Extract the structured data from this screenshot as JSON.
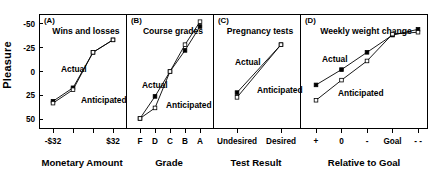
{
  "figure": {
    "y_axis_label": "Pleasure",
    "y_ticks": [
      "50",
      "25",
      "0",
      "-25",
      "-50"
    ],
    "series_names": [
      "Actual",
      "Anticipated"
    ],
    "ink_color": "#000000"
  },
  "panels": [
    {
      "key": "A",
      "panel_letter": "(A)",
      "title": "Wins and losses",
      "xlabel": "Monetary Amount",
      "x_tick_labels": [
        "-$32",
        "",
        "",
        "$32"
      ],
      "actual_label": "Actual",
      "anticipated_label": "Anticipated"
    },
    {
      "key": "B",
      "panel_letter": "(B)",
      "title": "Course grades",
      "xlabel": "Grade",
      "x_tick_labels": [
        "F",
        "D",
        "C",
        "B",
        "A"
      ],
      "actual_label": "Actual",
      "anticipated_label": "Anticipated"
    },
    {
      "key": "C",
      "panel_letter": "(C)",
      "title": "Pregnancy tests",
      "xlabel": "Test Result",
      "x_tick_labels": [
        "Undesired",
        "Desired"
      ],
      "actual_label": "Actual",
      "anticipated_label": "Anticipated"
    },
    {
      "key": "D",
      "panel_letter": "(D)",
      "title": "Weekly weight change",
      "xlabel": "Relative to Goal",
      "x_tick_labels": [
        "+",
        "0",
        "-",
        "Goal",
        "- -"
      ],
      "actual_label": "Actual",
      "anticipated_label": "Anticipated"
    }
  ],
  "chart_data": [
    {
      "type": "line",
      "panel": "A",
      "title": "Wins and losses",
      "xlabel": "Monetary Amount",
      "ylabel": "Pleasure",
      "ylim": [
        -60,
        60
      ],
      "yticks": [
        -50,
        -25,
        0,
        25,
        50
      ],
      "grid": false,
      "legend": "inline-annotation",
      "categories": [
        "-$32",
        "-$8",
        "$8",
        "$32"
      ],
      "series": [
        {
          "name": "Actual",
          "marker": "filled-square",
          "values": [
            -31,
            -17,
            20,
            33
          ]
        },
        {
          "name": "Anticipated",
          "marker": "open-square",
          "values": [
            -33,
            -19,
            20,
            33
          ]
        }
      ]
    },
    {
      "type": "line",
      "panel": "B",
      "title": "Course grades",
      "xlabel": "Grade",
      "ylabel": "Pleasure",
      "ylim": [
        -60,
        60
      ],
      "yticks": [
        -50,
        -25,
        0,
        25,
        50
      ],
      "grid": false,
      "legend": "inline-annotation",
      "categories": [
        "F",
        "D",
        "C",
        "B",
        "A"
      ],
      "series": [
        {
          "name": "Actual",
          "marker": "filled-square",
          "values": [
            -49,
            -26,
            0,
            22,
            47
          ]
        },
        {
          "name": "Anticipated",
          "marker": "open-square",
          "values": [
            -49,
            -38,
            0,
            28,
            52
          ]
        }
      ]
    },
    {
      "type": "line",
      "panel": "C",
      "title": "Pregnancy tests",
      "xlabel": "Test Result",
      "ylabel": "Pleasure",
      "ylim": [
        -60,
        60
      ],
      "yticks": [
        -50,
        -25,
        0,
        25,
        50
      ],
      "grid": false,
      "legend": "inline-annotation",
      "categories": [
        "Undesired",
        "Desired"
      ],
      "series": [
        {
          "name": "Actual",
          "marker": "filled-square",
          "values": [
            -22,
            28
          ]
        },
        {
          "name": "Anticipated",
          "marker": "open-square",
          "values": [
            -27,
            28
          ]
        }
      ]
    },
    {
      "type": "line",
      "panel": "D",
      "title": "Weekly weight change",
      "xlabel": "Relative to Goal",
      "ylabel": "Pleasure",
      "ylim": [
        -60,
        60
      ],
      "yticks": [
        -50,
        -25,
        0,
        25,
        50
      ],
      "grid": false,
      "legend": "inline-annotation",
      "categories": [
        "+",
        "0",
        "-",
        "Goal",
        "- -"
      ],
      "series": [
        {
          "name": "Actual",
          "marker": "filled-square",
          "values": [
            -14,
            2,
            20,
            38,
            44
          ]
        },
        {
          "name": "Anticipated",
          "marker": "open-square",
          "values": [
            -30,
            -9,
            11,
            39,
            41
          ]
        }
      ]
    }
  ]
}
